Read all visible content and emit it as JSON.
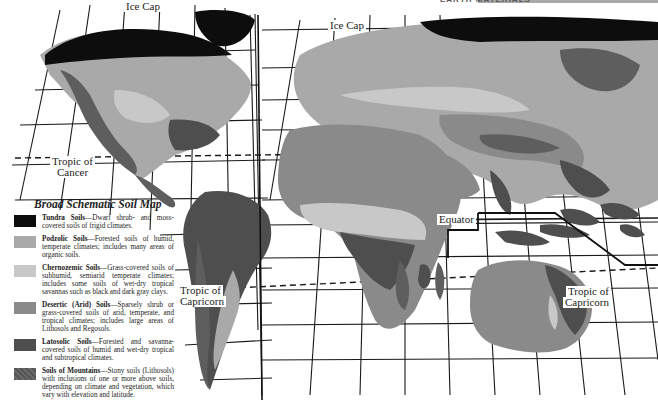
{
  "header": {
    "section_title": "EARTH MATERIALS"
  },
  "map": {
    "title": "Broad Schematic Soil Map",
    "labels": {
      "ice_cap_west": "Ice Cap",
      "ice_cap_east": "Ice Cap",
      "tropic_cancer_line1": "Tropic of",
      "tropic_cancer_line2": "Cancer",
      "equator": "Equator",
      "tropic_capricorn_west_line1": "Tropic of",
      "tropic_capricorn_west_line2": "Capricorn",
      "tropic_capricorn_east_line1": "Tropic of",
      "tropic_capricorn_east_line2": "Capricorn"
    },
    "colors": {
      "tundra": "#0d0d0d",
      "podzolic": "#a9a9a9",
      "chernozemic": "#c8c8c8",
      "desertic": "#8a8a8a",
      "latosolic": "#4e4e4e",
      "mountains": "#5e5e5e",
      "ocean": "#ffffff",
      "grid": "#1a1a1a"
    }
  },
  "legend": {
    "items": [
      {
        "name": "Tundra Soils",
        "desc": "—Dwarf shrub- and moss-covered soils of frigid climates.",
        "color": "#0d0d0d"
      },
      {
        "name": "Podzolic Soils",
        "desc": "—Forested soils of humid, temperate climates; includes many areas of organic soils.",
        "color": "#a9a9a9"
      },
      {
        "name": "Chernozemic Soils",
        "desc": "—Grass-covered soils of subhumid, semiarid temperate climates; includes some soils of wet-dry tropical savannas such as black and dark gray clays.",
        "color": "#c8c8c8"
      },
      {
        "name": "Desertic (Arid) Soils",
        "desc": "—Sparsely shrub or grass-covered soils of arid, temperate, and tropical climates; includes large areas of Lithosols and Regosols.",
        "color": "#8a8a8a"
      },
      {
        "name": "Latosolic Soils",
        "desc": "—Forested and savanna-covered soils of humid and wet-dry tropical and subtropical climates.",
        "color": "#4e4e4e"
      },
      {
        "name": "Soils of Mountains",
        "desc": "—Stony soils (Lithosols) with inclusions of one or more above soils, depending on climate and vegetation, which vary with elevation and latitude.",
        "color": "#5e5e5e"
      }
    ]
  }
}
